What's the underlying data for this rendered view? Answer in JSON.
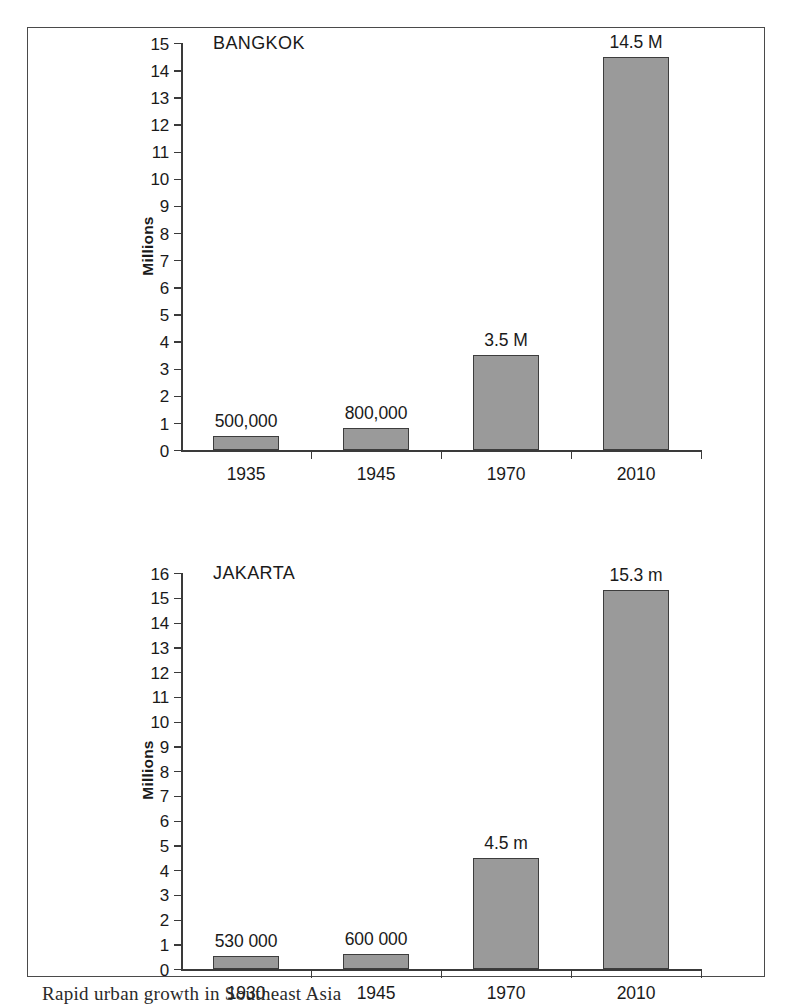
{
  "caption": "Rapid urban growth in Southeast Asia",
  "colors": {
    "bar_fill": "#9a9a9a",
    "bar_stroke": "#3d3d3d",
    "axis": "#3a3a3a",
    "frame": "#4a4a4a",
    "text": "#1a1a1a",
    "background": "#ffffff"
  },
  "chart_data": [
    {
      "type": "bar",
      "title": "BANGKOK",
      "xlabel": "",
      "ylabel": "Millions",
      "ylim": [
        0,
        15
      ],
      "ytick_step": 1,
      "yticks": [
        "15",
        "14",
        "13",
        "12",
        "11",
        "10",
        "9",
        "8",
        "7",
        "6",
        "5",
        "4",
        "3",
        "2",
        "1",
        "0"
      ],
      "grid": false,
      "legend": "none",
      "categories": [
        "1935",
        "1945",
        "1970",
        "2010"
      ],
      "values": [
        0.5,
        0.8,
        3.5,
        14.5
      ],
      "data_labels": [
        "500,000",
        "800,000",
        "3.5 M",
        "14.5 M"
      ]
    },
    {
      "type": "bar",
      "title": "JAKARTA",
      "xlabel": "",
      "ylabel": "Millions",
      "ylim": [
        0,
        16
      ],
      "ytick_step": 1,
      "yticks": [
        "16",
        "15",
        "14",
        "13",
        "12",
        "11",
        "10",
        "9",
        "8",
        "7",
        "6",
        "5",
        "4",
        "3",
        "2",
        "1",
        "0"
      ],
      "grid": false,
      "legend": "none",
      "categories": [
        "1930",
        "1945",
        "1970",
        "2010"
      ],
      "values": [
        0.53,
        0.6,
        4.5,
        15.3
      ],
      "data_labels": [
        "530 000",
        "600 000",
        "4.5 m",
        "15.3 m"
      ]
    }
  ]
}
